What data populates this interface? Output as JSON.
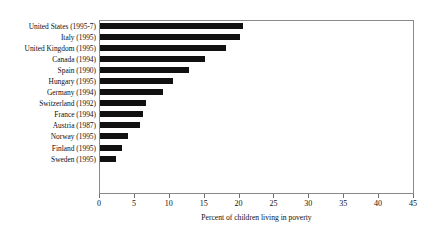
{
  "chart_data": {
    "type": "bar",
    "orientation": "horizontal",
    "title": "",
    "xlabel": "Percent of children living in poverty",
    "ylabel": "",
    "xlim": [
      0,
      45
    ],
    "xticks": [
      0,
      5,
      10,
      15,
      20,
      25,
      30,
      35,
      40,
      45
    ],
    "grid": false,
    "legend": false,
    "bar_color": "#111111",
    "frame_color": "#8a8a8a",
    "categories": [
      "United States (1995-7)",
      "Italy (1995)",
      "United Kingdom (1995)",
      "Canada (1994)",
      "Spain (1990)",
      "Hungary (1995)",
      "Germany (1994)",
      "Switzerland (1992)",
      "France (1994)",
      "Austria (1987)",
      "Norway (1995)",
      "Finland (1995)",
      "Sweden (1995)"
    ],
    "values": [
      20.5,
      20,
      18,
      15,
      12.7,
      10.4,
      9,
      6.6,
      6.1,
      5.7,
      4,
      3.2,
      2.3
    ]
  }
}
